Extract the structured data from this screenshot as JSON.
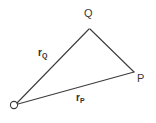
{
  "figure": {
    "type": "vector-triangle-diagram",
    "background_color": "#ffffff",
    "line_color": "#3b3b3b",
    "label_color": "#3a3a3a",
    "width": 156,
    "height": 123
  },
  "vertices": [
    {
      "id": "O",
      "label": "O",
      "x": 16,
      "y": 105,
      "marker": "circle",
      "role": "origin"
    },
    {
      "id": "Q",
      "label": "Q",
      "x": 90,
      "y": 28,
      "marker": "none",
      "role": "point"
    },
    {
      "id": "P",
      "label": "P",
      "x": 134,
      "y": 72,
      "marker": "none",
      "role": "point"
    }
  ],
  "edges": [
    {
      "id": "OQ",
      "from": "O",
      "to": "Q",
      "label_base": "r",
      "label_sub": "Q"
    },
    {
      "id": "OP",
      "from": "O",
      "to": "P",
      "label_base": "r",
      "label_sub": "P"
    },
    {
      "id": "QP",
      "from": "Q",
      "to": "P",
      "label_base": "",
      "label_sub": ""
    }
  ],
  "labels": {
    "vertex_O": "O",
    "vertex_Q": "Q",
    "vertex_P": "P",
    "edge_rQ_base": "r",
    "edge_rQ_sub": "Q",
    "edge_rP_base": "r",
    "edge_rP_sub": "P"
  }
}
